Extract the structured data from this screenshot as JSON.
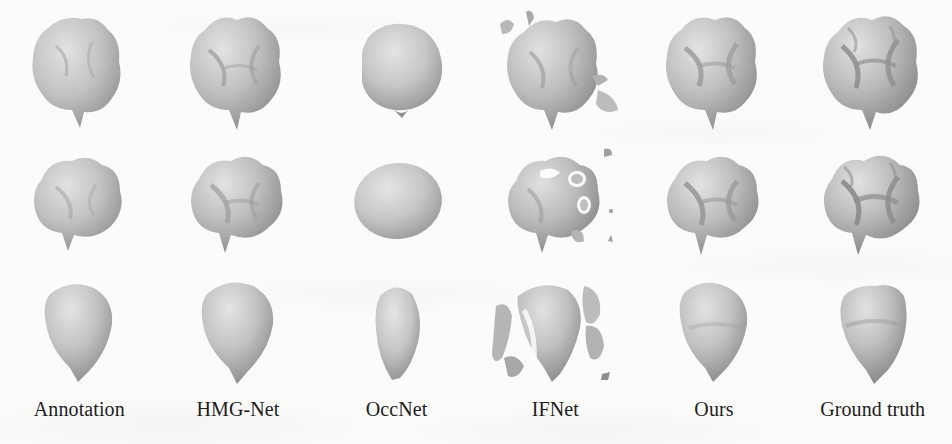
{
  "figure": {
    "kind": "qualitative-comparison-grid",
    "background_color": "#fbfbfa",
    "mesh_light_color": "#d8d8d6",
    "mesh_mid_color": "#b4b4b2",
    "mesh_dark_color": "#8e8e8c",
    "caption_color": "#1d1d1d",
    "columns": 6,
    "rows": 3
  },
  "columns": [
    {
      "id": "annotation",
      "label": "Annotation"
    },
    {
      "id": "hmg-net",
      "label": "HMG-Net"
    },
    {
      "id": "occnet",
      "label": "OccNet"
    },
    {
      "id": "ifnet",
      "label": "IFNet"
    },
    {
      "id": "ours",
      "label": "Ours"
    },
    {
      "id": "ground-truth",
      "label": "Ground truth"
    }
  ],
  "rows": [
    {
      "id": "row-occlusal-oblique",
      "view": "occlusal oblique view"
    },
    {
      "id": "row-occlusal-top",
      "view": "occlusal top view"
    },
    {
      "id": "row-buccal-profile",
      "view": "buccal profile view"
    }
  ],
  "cells": {
    "r0c0": {
      "shape": "molar-crown-smooth",
      "fragments": false,
      "notes": "rounded crown with soft cusps and single root tip"
    },
    "r0c1": {
      "shape": "molar-crown-grooved",
      "fragments": false,
      "notes": "crown with central fissure groove and root tip"
    },
    "r0c2": {
      "shape": "blob-featureless",
      "fragments": false,
      "notes": "over-smoothed ovoid, no cusp detail"
    },
    "r0c3": {
      "shape": "molar-crown-grooved",
      "fragments": true,
      "notes": "reconstructed crown with floating debris above and flake below"
    },
    "r0c4": {
      "shape": "molar-crown-grooved",
      "fragments": false,
      "notes": "crown with clear cusp ridges and root tip"
    },
    "r0c5": {
      "shape": "molar-crown-detailed",
      "fragments": false,
      "notes": "sharp cusps, deep fissures, pointed root"
    },
    "r1c0": {
      "shape": "molar-top-smooth",
      "fragments": false,
      "notes": "four rounded cusps, shallow fissure cross"
    },
    "r1c1": {
      "shape": "molar-top-grooved",
      "fragments": false,
      "notes": "four cusps with visible fissure pattern"
    },
    "r1c2": {
      "shape": "blob-featureless",
      "fragments": false,
      "notes": "flat oval, completely featureless"
    },
    "r1c3": {
      "shape": "molar-top-holes",
      "fragments": true,
      "notes": "perforated surface with holes and scattered specks"
    },
    "r1c4": {
      "shape": "molar-top-grooved",
      "fragments": false,
      "notes": "well-formed cusps with fissures"
    },
    "r1c5": {
      "shape": "molar-top-detailed",
      "fragments": false,
      "notes": "crisp cusp boundaries and deep fissures"
    },
    "r2c0": {
      "shape": "tooth-profile-teardrop",
      "fragments": false,
      "notes": "teardrop profile tapering to root apex"
    },
    "r2c1": {
      "shape": "tooth-profile-teardrop",
      "fragments": false,
      "notes": "teardrop profile, slightly wider crown"
    },
    "r2c2": {
      "shape": "tooth-profile-narrow",
      "fragments": false,
      "notes": "narrow asymmetric lobe, no root detail"
    },
    "r2c3": {
      "shape": "tooth-profile-broken",
      "fragments": true,
      "notes": "profile split by large surface tears and detached slabs"
    },
    "r2c4": {
      "shape": "tooth-profile-teardrop",
      "fragments": false,
      "notes": "clean teardrop profile with root apex"
    },
    "r2c5": {
      "shape": "tooth-profile-angular",
      "fragments": false,
      "notes": "angular crown shoulder tapering to root apex"
    }
  }
}
